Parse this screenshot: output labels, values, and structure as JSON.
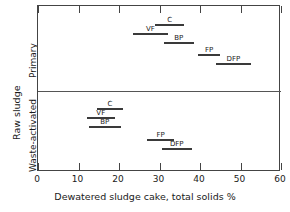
{
  "chart_data": {
    "type": "bar",
    "orientation": "horizontal",
    "title": "",
    "xlabel": "Dewatered sludge cake, total solids %",
    "ylabel": "Raw sludge",
    "xlim": [
      0,
      60
    ],
    "xticks": [
      0,
      10,
      20,
      30,
      40,
      50,
      60
    ],
    "xtick_labels": [
      "0",
      "10",
      "20",
      "30",
      "40",
      "50",
      "60"
    ],
    "grid": false,
    "legend": "none",
    "groups": [
      {
        "name": "Primary",
        "label": "Primary",
        "ranges": [
          {
            "label": "C",
            "low": 29.0,
            "high": 36.0
          },
          {
            "label": "VF",
            "low": 23.5,
            "high": 32.0
          },
          {
            "label": "BP",
            "low": 31.0,
            "high": 38.5
          },
          {
            "label": "FP",
            "low": 39.5,
            "high": 45.0
          },
          {
            "label": "DFP",
            "low": 44.0,
            "high": 52.5
          }
        ]
      },
      {
        "name": "Waste-activated",
        "label": "Waste-activated",
        "ranges": [
          {
            "label": "C",
            "low": 14.5,
            "high": 21.0
          },
          {
            "label": "VF",
            "low": 12.0,
            "high": 19.0
          },
          {
            "label": "BP",
            "low": 12.5,
            "high": 20.5
          },
          {
            "label": "FP",
            "low": 27.0,
            "high": 33.5
          },
          {
            "label": "DFP",
            "low": 30.5,
            "high": 38.0
          }
        ]
      }
    ]
  },
  "axis": {
    "x_title": "Dewatered sludge cake, total solids %",
    "y_outer_title": "Raw sludge",
    "y_primary_title": "Primary",
    "y_waste_title": "Waste-activated"
  },
  "colors": {
    "bar": "#3a3a3a",
    "frame": "#444444",
    "divider": "#555555",
    "background": "#ffffff",
    "text": "#1a1a1a"
  }
}
